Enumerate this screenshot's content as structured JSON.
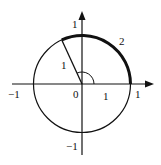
{
  "diagram": {
    "colors": {
      "stroke": "#111111",
      "background": "#ffffff"
    },
    "axes": {
      "x_labels": {
        "neg": "−1",
        "origin": "0",
        "pos": "1"
      },
      "y_labels": {
        "pos": "1",
        "neg": "−1"
      }
    },
    "labels": {
      "radius_length": "1",
      "arc_length": "2",
      "segment_on_x_axis": "1"
    }
  }
}
